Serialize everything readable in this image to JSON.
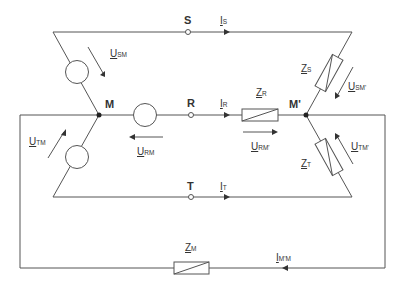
{
  "diagram": {
    "type": "circuit-schematic",
    "nodes": [
      {
        "id": "S",
        "label": "S"
      },
      {
        "id": "R",
        "label": "R"
      },
      {
        "id": "T",
        "label": "T"
      },
      {
        "id": "M",
        "label": "M"
      },
      {
        "id": "M_prime",
        "label": "M'"
      }
    ],
    "currents": [
      {
        "id": "I_S",
        "main": "I",
        "sub": "S"
      },
      {
        "id": "I_R",
        "main": "I",
        "sub": "R"
      },
      {
        "id": "I_T",
        "main": "I",
        "sub": "T"
      },
      {
        "id": "I_MpM",
        "main": "I",
        "sub": "M'M"
      }
    ],
    "voltages": [
      {
        "id": "U_SM",
        "main": "U",
        "sub": "SM"
      },
      {
        "id": "U_TM",
        "main": "U",
        "sub": "TM"
      },
      {
        "id": "U_RM",
        "main": "U",
        "sub": "RM"
      },
      {
        "id": "U_RMp",
        "main": "U",
        "sub": "RM'"
      },
      {
        "id": "U_SMp",
        "main": "U",
        "sub": "SM'"
      },
      {
        "id": "U_TMp",
        "main": "U",
        "sub": "TM'"
      }
    ],
    "impedances": [
      {
        "id": "Z_S",
        "main": "Z",
        "sub": "S"
      },
      {
        "id": "Z_R",
        "main": "Z",
        "sub": "R"
      },
      {
        "id": "Z_T",
        "main": "Z",
        "sub": "T"
      },
      {
        "id": "Z_M",
        "main": "Z",
        "sub": "M"
      }
    ],
    "sources": [
      {
        "id": "source_S",
        "phase": "S"
      },
      {
        "id": "source_R",
        "phase": "R"
      },
      {
        "id": "source_T",
        "phase": "T"
      }
    ],
    "colors": {
      "wire": "#555555",
      "text": "#333333",
      "background": "#ffffff"
    }
  }
}
